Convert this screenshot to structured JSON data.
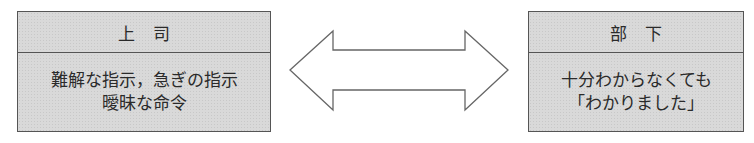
{
  "diagram": {
    "left_box": {
      "title": "上司",
      "lines": [
        "難解な指示，急ぎの指示",
        "曖昧な命令"
      ]
    },
    "right_box": {
      "title": "部下",
      "lines": [
        "十分わからなくても",
        "「わかりました」"
      ]
    },
    "connector": "double-headed-arrow",
    "colors": {
      "box_fill": "#d9d9d9",
      "border": "#555555",
      "arrow_stroke": "#666666"
    }
  }
}
